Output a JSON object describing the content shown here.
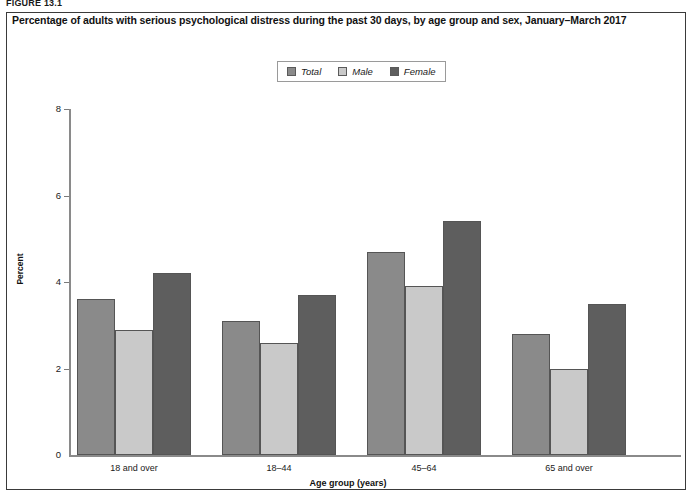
{
  "figure": {
    "label": "FIGURE 13.1"
  },
  "chart_title": "Percentage of adults with serious psychological distress during the past 30 days, by age group and sex, January–March 2017",
  "legend": {
    "items": [
      {
        "label": "Total",
        "color": "#8a8a8a"
      },
      {
        "label": "Male",
        "color": "#c9c9c9"
      },
      {
        "label": "Female",
        "color": "#5e5e5e"
      }
    ]
  },
  "axes": {
    "y_title": "Percent",
    "x_title": "Age group (years)",
    "y_ticks": [
      "0",
      "2",
      "4",
      "6",
      "8"
    ]
  },
  "chart_data": {
    "type": "bar",
    "title": "Percentage of adults with serious psychological distress during the past 30 days, by age group and sex, January–March 2017",
    "xlabel": "Age group (years)",
    "ylabel": "Percent",
    "ylim": [
      0,
      8
    ],
    "yticks": [
      0,
      2,
      4,
      6,
      8
    ],
    "grid": false,
    "legend_position": "top-center",
    "categories": [
      "18 and over",
      "18–44",
      "45–64",
      "65 and over"
    ],
    "series": [
      {
        "name": "Total",
        "color": "#8a8a8a",
        "values": [
          3.6,
          3.1,
          4.7,
          2.8
        ]
      },
      {
        "name": "Male",
        "color": "#c9c9c9",
        "values": [
          2.9,
          2.6,
          3.9,
          2.0
        ]
      },
      {
        "name": "Female",
        "color": "#5e5e5e",
        "values": [
          4.2,
          3.7,
          5.4,
          3.5
        ]
      }
    ]
  }
}
